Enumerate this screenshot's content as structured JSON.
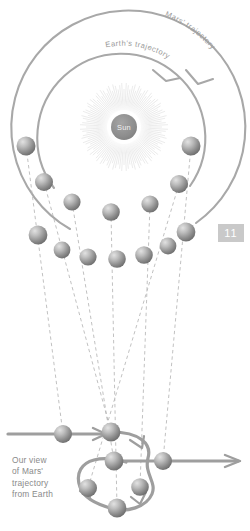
{
  "diagram": {
    "page_number": "11",
    "colors": {
      "orbit_stroke": "#a8a8a8",
      "sightline_stroke": "#b6b6b6",
      "planet_light": "#d2d2d2",
      "planet_dark": "#6f6f6f",
      "sun_disc": "#8d8d8d",
      "sun_rays": "#d9d9d9",
      "label_text": "#9a9a9a",
      "caption_text": "#8a8a8a",
      "page_tab_bg": "#c9c9c9",
      "page_tab_text": "#ffffff",
      "background": "#ffffff"
    },
    "sun": {
      "label": "Sun",
      "cx": 124,
      "cy": 127,
      "radius": 13,
      "ray_count": 120,
      "ray_inner": 17,
      "ray_outer": 44
    },
    "orbits": [
      {
        "name": "mars-orbit",
        "label": "Mars' trajectory",
        "cx": 124,
        "cy": 127,
        "radius": 117,
        "direction": "counterclockwise",
        "arrow": true
      },
      {
        "name": "earth-orbit",
        "label": "Earth's trajectory",
        "cx": 124,
        "cy": 127,
        "radius": 84,
        "direction": "counterclockwise",
        "arrow": true
      }
    ],
    "earth_positions": [
      {
        "x": 26,
        "y": 146,
        "r": 9.5
      },
      {
        "x": 44,
        "y": 182,
        "r": 9.0
      },
      {
        "x": 72,
        "y": 202,
        "r": 8.6
      },
      {
        "x": 111,
        "y": 212,
        "r": 8.8
      },
      {
        "x": 150,
        "y": 204,
        "r": 8.6
      },
      {
        "x": 179,
        "y": 184,
        "r": 9.0
      },
      {
        "x": 191,
        "y": 146,
        "r": 9.5
      }
    ],
    "mars_positions": [
      {
        "x": 38,
        "y": 235,
        "r": 9.4
      },
      {
        "x": 62,
        "y": 250,
        "r": 8.4
      },
      {
        "x": 88,
        "y": 257,
        "r": 8.6
      },
      {
        "x": 117,
        "y": 259,
        "r": 8.8
      },
      {
        "x": 144,
        "y": 255,
        "r": 8.8
      },
      {
        "x": 168,
        "y": 246,
        "r": 8.4
      },
      {
        "x": 186,
        "y": 232,
        "r": 9.4
      }
    ],
    "observed_path": {
      "name": "retrograde-loop",
      "entry_line": {
        "x1": 8,
        "y1": 434,
        "x2": 120,
        "y2": 434
      },
      "exit_line": {
        "x1": 120,
        "y1": 462,
        "x2": 240,
        "y2": 462
      },
      "loop_description": "Mars appears to move right, loop backwards, then continue right"
    },
    "observed_positions": [
      {
        "x": 63,
        "y": 434,
        "r": 9.0
      },
      {
        "x": 111,
        "y": 432,
        "r": 9.4
      },
      {
        "x": 114,
        "y": 461,
        "r": 9.4
      },
      {
        "x": 88,
        "y": 488,
        "r": 9.0
      },
      {
        "x": 140,
        "y": 487,
        "r": 8.8
      },
      {
        "x": 117,
        "y": 508,
        "r": 9.4
      },
      {
        "x": 163,
        "y": 461,
        "r": 9.0
      }
    ],
    "sightlines": [
      {
        "from": "earth-1",
        "x1": 26,
        "y1": 146,
        "x2": 63,
        "y2": 434
      },
      {
        "from": "earth-2",
        "x1": 44,
        "y1": 182,
        "x2": 111,
        "y2": 432
      },
      {
        "from": "earth-3",
        "x1": 72,
        "y1": 202,
        "x2": 114,
        "y2": 461
      },
      {
        "from": "earth-4",
        "x1": 111,
        "y1": 212,
        "x2": 117,
        "y2": 508
      },
      {
        "from": "earth-5",
        "x1": 150,
        "y1": 204,
        "x2": 140,
        "y2": 487
      },
      {
        "from": "earth-6",
        "x1": 179,
        "y1": 184,
        "x2": 88,
        "y2": 488
      },
      {
        "from": "earth-7",
        "x1": 191,
        "y1": 146,
        "x2": 163,
        "y2": 461
      }
    ],
    "caption": {
      "lines": [
        "Our view",
        "of Mars'",
        "trajectory",
        "from Earth"
      ],
      "full_text": "Our view of Mars' trajectory from Earth"
    }
  }
}
